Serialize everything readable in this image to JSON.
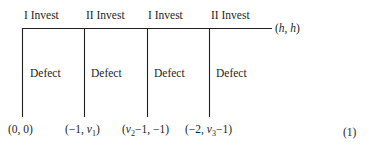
{
  "game_tree": {
    "moves": [
      {
        "player": "I",
        "action": "Invest",
        "label": "I Invest",
        "alt_action": "Defect",
        "payoff": {
          "text": "(0, 0)"
        }
      },
      {
        "player": "II",
        "action": "Invest",
        "label": "II Invest",
        "alt_action": "Defect",
        "payoff": {
          "text": "(−1, v1)"
        }
      },
      {
        "player": "I",
        "action": "Invest",
        "label": "I Invest",
        "alt_action": "Defect",
        "payoff": {
          "text": "(v2−1, −1)"
        }
      },
      {
        "player": "II",
        "action": "Invest",
        "label": "II Invest",
        "alt_action": "Defect",
        "payoff": {
          "text": "(−2, v3−1)"
        }
      }
    ],
    "terminal_payoff": "(h, h)",
    "payoff_parts": {
      "p0": "(0, 0)",
      "p1_pre": "(−1, ",
      "p1_var": "v",
      "p1_sub": "1",
      "p1_post": ")",
      "p2_pre": "(",
      "p2_var": "v",
      "p2_sub": "2",
      "p2_post": "−1, −1)",
      "p3_pre": "(−2, ",
      "p3_var": "v",
      "p3_sub": "3",
      "p3_post": "−1)",
      "term_pre": "(",
      "term_h1": "h",
      "term_mid": ", ",
      "term_h2": "h",
      "term_post": ")"
    },
    "equation_number": "(1)"
  }
}
